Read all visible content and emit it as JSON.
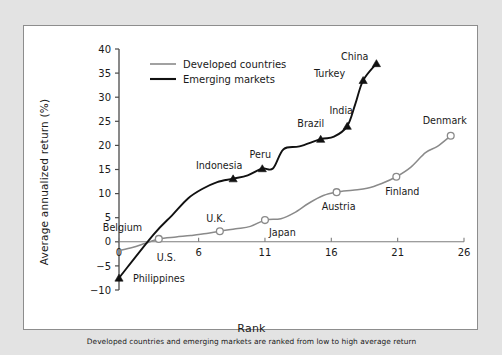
{
  "figure": {
    "panel_bg": "#ffffff",
    "outer_bg": "#e3e3e3",
    "border_color": "#8d8d8d"
  },
  "legend": {
    "position": "top-left",
    "items": [
      {
        "label": "Developed countries",
        "color": "#8a8a8a",
        "marker": "open-circle"
      },
      {
        "label": "Emerging markets",
        "color": "#111111",
        "marker": "filled-triangle"
      }
    ]
  },
  "chart_data": {
    "type": "line",
    "title": "",
    "xlabel": "Rank",
    "ylabel": "Average annualized return (%)",
    "subtitle": "Developed countries and emerging markets are ranked from low to high average return",
    "xlim": [
      0,
      26
    ],
    "ylim": [
      -10,
      40
    ],
    "xticks": [
      0,
      6,
      11,
      16,
      21,
      26
    ],
    "yticks": [
      -10,
      -5,
      0,
      5,
      10,
      15,
      20,
      25,
      30,
      35,
      40
    ],
    "grid": false,
    "zero_line": true,
    "series": [
      {
        "name": "Developed countries",
        "color": "#8a8a8a",
        "marker": "open-circle",
        "x": [
          0.0,
          1.0,
          2.0,
          3.0,
          4.3,
          5.4,
          6.6,
          7.6,
          8.8,
          9.9,
          11.0,
          12.2,
          13.2,
          14.3,
          15.4,
          16.4,
          17.6,
          18.7,
          19.8,
          20.9,
          22.0,
          23.1,
          24.0,
          25.0
        ],
        "y": [
          -1.8,
          -1.2,
          -0.3,
          0.6,
          1.0,
          1.3,
          1.7,
          2.2,
          2.7,
          3.2,
          4.5,
          4.8,
          6.0,
          8.0,
          9.6,
          10.3,
          10.7,
          11.1,
          12.1,
          13.5,
          15.5,
          18.5,
          19.8,
          22.0
        ],
        "markers_x": [
          3.0,
          7.6,
          11.0,
          16.4,
          20.9,
          25.0
        ],
        "markers_y": [
          0.6,
          2.2,
          4.5,
          10.3,
          13.5,
          22.0
        ]
      },
      {
        "name": "Emerging markets",
        "color": "#111111",
        "marker": "filled-triangle",
        "x": [
          0.0,
          2.6,
          4.0,
          5.2,
          6.3,
          7.4,
          8.6,
          9.7,
          10.8,
          11.6,
          12.4,
          13.6,
          15.2,
          16.2,
          17.2,
          17.8,
          18.4,
          19.4
        ],
        "y": [
          -7.5,
          1.5,
          5.5,
          9.0,
          11.0,
          12.4,
          13.1,
          13.8,
          15.2,
          15.2,
          19.2,
          19.8,
          21.3,
          21.8,
          24.0,
          28.5,
          33.5,
          37.0
        ],
        "markers_x": [
          0.0,
          8.6,
          10.8,
          15.2,
          17.2,
          18.4,
          19.4
        ],
        "markers_y": [
          -7.5,
          13.1,
          15.2,
          21.3,
          24.0,
          33.5,
          37.0
        ]
      }
    ],
    "annotations": [
      {
        "text": "Philippines",
        "x": 0.0,
        "y": -7.5,
        "dx": 14,
        "dy": 4,
        "anchor": "start",
        "series": "Emerging markets"
      },
      {
        "text": "Belgium",
        "x": 3.0,
        "y": 0.6,
        "dx": -56,
        "dy": -8,
        "anchor": "start",
        "series": "Developed countries"
      },
      {
        "text": "U.S.",
        "x": 3.0,
        "y": 0.6,
        "dx": -2,
        "dy": 22,
        "anchor": "start",
        "series": "Developed countries"
      },
      {
        "text": "U.K.",
        "x": 7.6,
        "y": 2.2,
        "dx": -4,
        "dy": -9,
        "anchor": "middle",
        "series": "Developed countries"
      },
      {
        "text": "Indonesia",
        "x": 8.6,
        "y": 13.1,
        "dx": -14,
        "dy": -10,
        "anchor": "middle",
        "series": "Emerging markets"
      },
      {
        "text": "Japan",
        "x": 11.0,
        "y": 4.5,
        "dx": 4,
        "dy": 16,
        "anchor": "start",
        "series": "Developed countries"
      },
      {
        "text": "Peru",
        "x": 10.8,
        "y": 15.2,
        "dx": -2,
        "dy": -11,
        "anchor": "middle",
        "series": "Emerging markets"
      },
      {
        "text": "Brazil",
        "x": 15.2,
        "y": 21.3,
        "dx": -10,
        "dy": -12,
        "anchor": "middle",
        "series": "Emerging markets"
      },
      {
        "text": "Austria",
        "x": 16.4,
        "y": 10.3,
        "dx": 2,
        "dy": 18,
        "anchor": "middle",
        "series": "Developed countries"
      },
      {
        "text": "India",
        "x": 17.2,
        "y": 24.0,
        "dx": -6,
        "dy": -12,
        "anchor": "middle",
        "series": "Emerging markets"
      },
      {
        "text": "Turkey",
        "x": 18.4,
        "y": 33.5,
        "dx": -18,
        "dy": -3,
        "anchor": "end",
        "series": "Emerging markets"
      },
      {
        "text": "China",
        "x": 19.4,
        "y": 37.0,
        "dx": -8,
        "dy": -3,
        "anchor": "end",
        "series": "Emerging markets"
      },
      {
        "text": "Finland",
        "x": 20.9,
        "y": 13.5,
        "dx": 6,
        "dy": 18,
        "anchor": "middle",
        "series": "Developed countries"
      },
      {
        "text": "Denmark",
        "x": 25.0,
        "y": 22.0,
        "dx": -6,
        "dy": -12,
        "anchor": "middle",
        "series": "Developed countries"
      }
    ]
  }
}
